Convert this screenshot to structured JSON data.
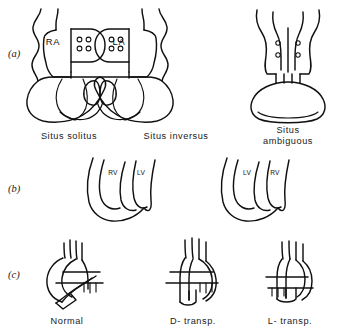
{
  "figure": {
    "ink_color": "#101010",
    "background_color": "#ffffff"
  },
  "rows": {
    "a": {
      "tag": "(a)",
      "panels": [
        {
          "label": "Situs solitus",
          "chamber_left": "RA",
          "chamber_right": "LA",
          "vein_dots": 4
        },
        {
          "label": "Situs inversus",
          "vein_dots": 4
        },
        {
          "label_line1": "Situs",
          "label_line2": "ambiguous",
          "vein_dots_left": 2,
          "vein_dots_right": 2
        }
      ]
    },
    "b": {
      "tag": "(b)",
      "panels": [
        {
          "vent_left": "RV",
          "vent_right": "LV"
        },
        {
          "vent_left": "LV",
          "vent_right": "RV"
        }
      ]
    },
    "c": {
      "tag": "(c)",
      "panels": [
        {
          "label": "Normal"
        },
        {
          "label": "D- transp."
        },
        {
          "label": "L- transp."
        }
      ]
    }
  }
}
